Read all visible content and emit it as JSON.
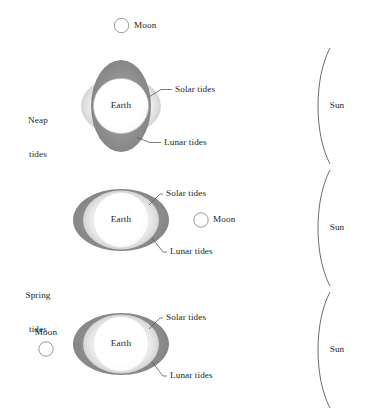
{
  "figure": {
    "type": "diagram",
    "background_color": "#ffffff",
    "text_color": "#231f20",
    "colors": {
      "lunar_tide_gray": "#8d8d8d",
      "solar_tide_gray": "#e2e2e2",
      "earth_fill": "#ffffff",
      "outline_gray": "#8d8d8d",
      "leader_line": "#5a5a5a",
      "sun_arc": "#5a5a5a"
    }
  },
  "group_labels": [
    {
      "id": "neap",
      "line1": "Neap",
      "line2": "tides"
    },
    {
      "id": "spring",
      "line1": "Spring",
      "line2": "tides"
    }
  ],
  "panels": [
    {
      "id": "neap-panel",
      "earth_label": "Earth",
      "moon_label": "Moon",
      "sun_label": "Sun",
      "solar_tides_label": "Solar tides",
      "lunar_tides_label": "Lunar tides",
      "moon_position": "above-earth",
      "alignment": "quadrature"
    },
    {
      "id": "spring-panel-1",
      "earth_label": "Earth",
      "moon_label": "Moon",
      "sun_label": "Sun",
      "solar_tides_label": "Solar tides",
      "lunar_tides_label": "Lunar tides",
      "moon_position": "between-earth-and-sun",
      "alignment": "conjunction"
    },
    {
      "id": "spring-panel-2",
      "earth_label": "Earth",
      "moon_label": "Moon",
      "sun_label": "Sun",
      "solar_tides_label": "Solar tides",
      "lunar_tides_label": "Lunar tides",
      "moon_position": "opposite-side-from-sun",
      "alignment": "opposition"
    }
  ]
}
